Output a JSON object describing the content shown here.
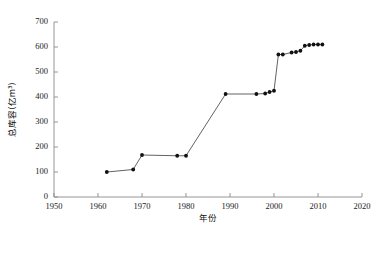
{
  "chart_data": {
    "type": "line",
    "title": "",
    "xlabel": "年份",
    "ylabel": "总库容(亿m³)",
    "xlim": [
      1950,
      2020
    ],
    "ylim": [
      0,
      700
    ],
    "xticks": [
      1950,
      1960,
      1970,
      1980,
      1990,
      2000,
      2010,
      2020
    ],
    "yticks": [
      0,
      100,
      200,
      300,
      400,
      500,
      600,
      700
    ],
    "grid": false,
    "legend": null,
    "marker": "filled-circle",
    "series": [
      {
        "name": "总库容",
        "x": [
          1962,
          1968,
          1970,
          1978,
          1980,
          1989,
          1996,
          1998,
          1999,
          2000,
          2001,
          2002,
          2004,
          2005,
          2006,
          2007,
          2008,
          2009,
          2010,
          2011
        ],
        "values": [
          100,
          110,
          168,
          165,
          165,
          412,
          412,
          414,
          420,
          425,
          570,
          570,
          578,
          580,
          585,
          605,
          608,
          610,
          610,
          610
        ]
      }
    ]
  }
}
